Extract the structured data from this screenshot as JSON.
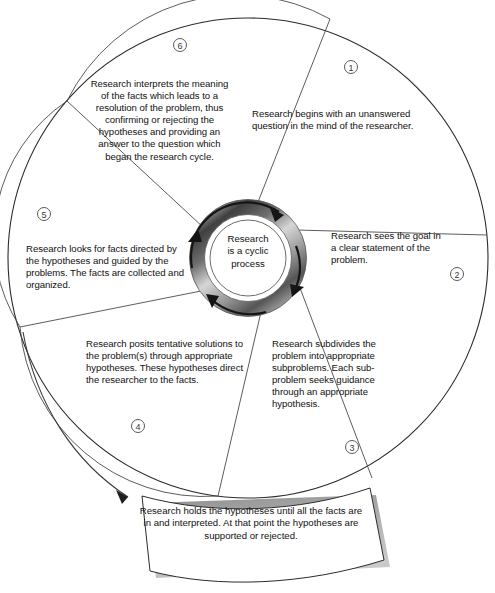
{
  "diagram": {
    "center": {
      "line1": "Research",
      "line2": "is a cyclic",
      "line3": "process"
    },
    "segments": [
      {
        "number": "1",
        "text": "Research begins with an unanswered question in the mind of the researcher."
      },
      {
        "number": "2",
        "text": "Research sees the goal in a clear statement of the problem."
      },
      {
        "number": "3",
        "text": "Research subdivides the problem into appropriate subproblems. Each sub-problem seeks guidance through an appropriate hypothesis."
      },
      {
        "number": "4",
        "text": "Research posits tentative solutions to the problem(s) through appropriate hypotheses. These hypotheses direct the researcher to the facts."
      },
      {
        "number": "5",
        "text": "Research looks for facts directed by the hypotheses and guided by the problems. The facts are collected and organized."
      },
      {
        "number": "6",
        "text": "Research interprets the meaning of the facts which leads to a resolution of the problem, thus confirming or rejecting the hypotheses and providing an answer to the question which began the research cycle."
      }
    ],
    "banner": {
      "text": "Research holds the hypotheses until all the facts are in and interpreted. At that point the hypotheses are supported or rejected."
    },
    "colors": {
      "outline": "#2b2b2b",
      "divider": "#4d4d4d",
      "ring_dark": "#4a4a4a",
      "ring_light": "#d8d8d8",
      "shadow": "#b7b7b7",
      "text": "#111111",
      "background": "#ffffff"
    }
  }
}
